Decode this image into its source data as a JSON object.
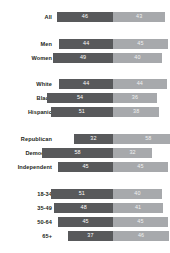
{
  "chart_data": {
    "type": "bar",
    "title": "",
    "subtitle": "",
    "xlabel": "",
    "ylabel": "",
    "orientation": "horizontal",
    "stacked": true,
    "grid": false,
    "legend_position": "none",
    "xlim": [
      0,
      100
    ],
    "colors": {
      "series_1": "#58595b",
      "series_2": "#a7a9ac",
      "background": "#ffffff",
      "label_text": "#231f20",
      "value_text": "#ffffff"
    },
    "series": [
      {
        "name": "Series 1",
        "color": "#58595b",
        "values": [
          46,
          44,
          49,
          44,
          54,
          51,
          32,
          58,
          45,
          51,
          48,
          45,
          37
        ]
      },
      {
        "name": "Series 2",
        "color": "#a7a9ac",
        "values": [
          43,
          45,
          40,
          44,
          36,
          38,
          58,
          32,
          45,
          40,
          41,
          45,
          46
        ]
      }
    ],
    "categories": [
      "All",
      "Men",
      "Women",
      "White",
      "Black",
      "Hispanic",
      "Republican",
      "Democrat",
      "Independent",
      "18-34",
      "35-49",
      "50-64",
      "65+"
    ],
    "groups": [
      {
        "name": "overall",
        "rows": [
          {
            "label": "All",
            "left_value": 46,
            "right_value": 43
          }
        ]
      },
      {
        "name": "gender",
        "rows": [
          {
            "label": "Men",
            "left_value": 44,
            "right_value": 45
          },
          {
            "label": "Women",
            "left_value": 49,
            "right_value": 40
          }
        ]
      },
      {
        "name": "race",
        "rows": [
          {
            "label": "White",
            "left_value": 44,
            "right_value": 44
          },
          {
            "label": "Black",
            "left_value": 54,
            "right_value": 36
          },
          {
            "label": "Hispanic",
            "left_value": 51,
            "right_value": 38
          }
        ]
      },
      {
        "name": "party",
        "rows": [
          {
            "label": "Republican",
            "left_value": 32,
            "right_value": 58
          },
          {
            "label": "Democrat",
            "left_value": 58,
            "right_value": 32
          },
          {
            "label": "Independent",
            "left_value": 45,
            "right_value": 45
          }
        ]
      },
      {
        "name": "age",
        "rows": [
          {
            "label": "18-34",
            "left_value": 51,
            "right_value": 40
          },
          {
            "label": "35-49",
            "left_value": 48,
            "right_value": 41
          },
          {
            "label": "50-64",
            "left_value": 45,
            "right_value": 45
          },
          {
            "label": "65+",
            "left_value": 37,
            "right_value": 46
          }
        ]
      }
    ]
  },
  "rows": [
    {
      "label": "All",
      "left_value": 46,
      "right_value": 43,
      "top": 11
    },
    {
      "label": "Men",
      "left_value": 44,
      "right_value": 45,
      "top": 38
    },
    {
      "label": "Women",
      "left_value": 49,
      "right_value": 40,
      "top": 52
    },
    {
      "label": "White",
      "left_value": 44,
      "right_value": 44,
      "top": 78
    },
    {
      "label": "Black",
      "left_value": 54,
      "right_value": 36,
      "top": 92
    },
    {
      "label": "Hispanic",
      "left_value": 51,
      "right_value": 38,
      "top": 106
    },
    {
      "label": "Republican",
      "left_value": 32,
      "right_value": 58,
      "top": 133
    },
    {
      "label": "Democrat",
      "left_value": 58,
      "right_value": 32,
      "top": 147
    },
    {
      "label": "Independent",
      "left_value": 45,
      "right_value": 45,
      "top": 161
    },
    {
      "label": "18-34",
      "left_value": 51,
      "right_value": 40,
      "top": 188
    },
    {
      "label": "35-49",
      "left_value": 48,
      "right_value": 41,
      "top": 202
    },
    {
      "label": "50-64",
      "left_value": 45,
      "right_value": 45,
      "top": 216
    },
    {
      "label": "65+",
      "left_value": 37,
      "right_value": 46,
      "top": 230
    }
  ]
}
